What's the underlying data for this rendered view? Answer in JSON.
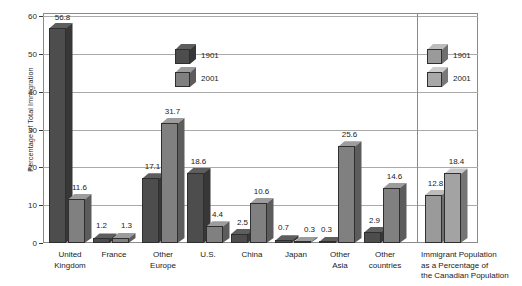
{
  "chart_data": {
    "type": "bar",
    "title": "",
    "xlabel": "",
    "ylabel": "Percentage of Total Immigration",
    "ylim": [
      0,
      60
    ],
    "yticks": [
      0,
      10,
      20,
      30,
      40,
      50,
      60
    ],
    "grid": true,
    "legend_position": "inside-upper-center",
    "categories": [
      "United\nKingdom",
      "France",
      "Other\nEurope",
      "U.S.",
      "China",
      "Japan",
      "Other\nAsia",
      "Other\ncountries",
      "Immigrant Population\nas a Percentage of\nthe Canadian Population"
    ],
    "series": [
      {
        "name": "1901",
        "color": "#4d4d4d",
        "values": [
          56.8,
          1.2,
          17.1,
          18.6,
          2.5,
          0.7,
          0.3,
          2.9,
          12.8
        ]
      },
      {
        "name": "2001",
        "color": "#808080",
        "values": [
          11.6,
          1.3,
          31.7,
          4.4,
          10.6,
          0.3,
          25.6,
          14.6,
          18.4
        ]
      }
    ],
    "panel_note": "Last category group is drawn in a separate right-hand panel with lighter bars and its own legend",
    "panel_series_color": "#9a9a9a"
  },
  "legend_main": {
    "name": "legend-main",
    "items": [
      {
        "label": "1901",
        "color": "#4d4d4d"
      },
      {
        "label": "2001",
        "color": "#808080"
      }
    ]
  },
  "legend_panel": {
    "name": "legend-panel",
    "items": [
      {
        "label": "1901",
        "color": "#9a9a9a"
      },
      {
        "label": "2001",
        "color": "#a8a8a8"
      }
    ]
  },
  "axis": {
    "ytick_labels": [
      "0",
      "10",
      "20",
      "30",
      "40",
      "50",
      "60"
    ],
    "ylabel": "Percentage of Total Immigration"
  },
  "value_labels": {
    "uk_1901": "56.8",
    "uk_2001": "11.6",
    "france_1901": "1.2",
    "france_2001": "1.3",
    "othereurope_1901": "17.1",
    "othereurope_2001": "31.7",
    "us_1901": "18.6",
    "us_2001": "4.4",
    "china_1901": "2.5",
    "china_2001": "10.6",
    "japan_1901": "0.7",
    "japan_2001": "0.3",
    "otherasia_1901": "0.3",
    "otherasia_2001": "25.6",
    "othercountries_1901": "2.9",
    "othercountries_2001": "14.6",
    "panel_1901": "12.8",
    "panel_2001": "18.4"
  },
  "category_labels": {
    "c0": "United\nKingdom",
    "c1": "France",
    "c2": "Other\nEurope",
    "c3": "U.S.",
    "c4": "China",
    "c5": "Japan",
    "c6": "Other\nAsia",
    "c7": "Other\ncountries",
    "c8": "Immigrant Population\nas a Percentage of\nthe Canadian Population"
  }
}
